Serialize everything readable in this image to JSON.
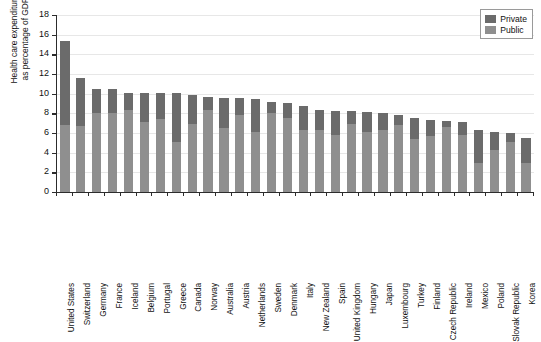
{
  "chart_data": {
    "type": "bar",
    "subtype": "stacked-bar",
    "title": "",
    "xlabel": "",
    "ylabel": "Health care expenditure as percentage of GDP",
    "ylabel_lines": [
      "Health care expenditure",
      "as percentage of GDP"
    ],
    "ylim": [
      0,
      18
    ],
    "ytick_step": 2,
    "yticks": [
      0,
      2,
      4,
      6,
      8,
      10,
      12,
      14,
      16,
      18
    ],
    "ytick_labels": [
      "0",
      "2",
      "4",
      "6",
      "8",
      "10",
      "12",
      "14",
      "16",
      "18"
    ],
    "grid": true,
    "grid_axis": "y",
    "legend_position": "top-right",
    "categories": [
      "United States",
      "Switzerland",
      "Germany",
      "France",
      "Iceland",
      "Belgium",
      "Portugal",
      "Greece",
      "Canada",
      "Norway",
      "Australia",
      "Austria",
      "Netherlands",
      "Sweden",
      "Denmark",
      "Italy",
      "New Zealand",
      "Spain",
      "United Kingdom",
      "Hungary",
      "Japan",
      "Luxembourg",
      "Turkey",
      "Finland",
      "Czech Republic",
      "Ireland",
      "Mexico",
      "Poland",
      "Slovak Republic",
      "Korea"
    ],
    "series": [
      {
        "name": "Public",
        "color": "#8f8f8f",
        "values": [
          6.8,
          6.7,
          8.0,
          8.0,
          8.3,
          7.1,
          7.4,
          5.1,
          6.9,
          8.3,
          6.5,
          7.8,
          6.1,
          8.0,
          7.5,
          6.3,
          6.3,
          5.8,
          6.9,
          6.1,
          6.3,
          6.8,
          5.4,
          5.7,
          6.6,
          5.8,
          3.0,
          4.3,
          5.1,
          2.9
        ]
      },
      {
        "name": "Private",
        "color": "#6b6b6b",
        "values": [
          8.6,
          4.9,
          2.5,
          2.5,
          1.8,
          3.0,
          2.7,
          5.0,
          3.0,
          1.4,
          3.1,
          1.8,
          3.4,
          1.2,
          1.6,
          2.4,
          2.0,
          2.4,
          1.3,
          2.0,
          1.7,
          1.0,
          2.1,
          1.6,
          0.6,
          1.3,
          3.3,
          1.8,
          0.9,
          2.6
        ]
      }
    ],
    "totals": [
      15.4,
      11.6,
      10.5,
      10.5,
      10.1,
      10.1,
      10.1,
      10.1,
      9.9,
      9.7,
      9.6,
      9.6,
      9.5,
      9.2,
      9.1,
      8.7,
      8.3,
      8.2,
      8.2,
      8.1,
      8.0,
      7.8,
      7.5,
      7.3,
      7.2,
      7.1,
      6.3,
      6.1,
      6.0,
      5.5
    ]
  },
  "legend": {
    "items": [
      {
        "label": "Private",
        "color": "#6b6b6b"
      },
      {
        "label": "Public",
        "color": "#8f8f8f"
      }
    ]
  },
  "colors": {
    "private": "#6b6b6b",
    "public": "#8f8f8f",
    "axis": "#2c2c2c",
    "grid": "#e7e7e7",
    "background": "#ffffff"
  }
}
